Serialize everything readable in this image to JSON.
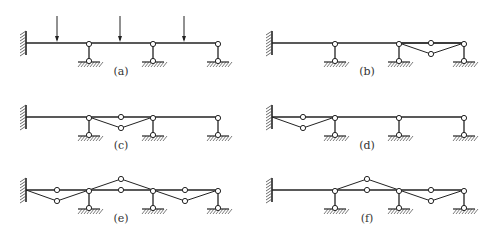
{
  "figure": {
    "panels": [
      {
        "id": "a",
        "label": "(a)",
        "ox": 0,
        "oy": 0,
        "members": [],
        "loads": [
          57,
          120,
          184
        ]
      },
      {
        "id": "b",
        "label": "(b)",
        "ox": 246,
        "oy": 0,
        "members": [
          [
            [
              153,
              43
            ],
            [
              185,
              43
            ],
            [
              218,
              43
            ],
            [
              185,
              54
            ],
            [
              153,
              43
            ]
          ]
        ],
        "hinges": [
          [
            185,
            43
          ],
          [
            185,
            54
          ]
        ],
        "loads": []
      },
      {
        "id": "c",
        "label": "(c)",
        "ox": 0,
        "oy": 74,
        "members": [
          [
            [
              89,
              43
            ],
            [
              121,
              54
            ],
            [
              153,
              43
            ]
          ]
        ],
        "hinges": [
          [
            121,
            43
          ],
          [
            121,
            54
          ]
        ],
        "loads": []
      },
      {
        "id": "d",
        "label": "(d)",
        "ox": 246,
        "oy": 74,
        "members": [
          [
            [
              26,
              43
            ],
            [
              57,
              54
            ],
            [
              89,
              43
            ]
          ]
        ],
        "hinges": [
          [
            57,
            43
          ],
          [
            57,
            54
          ]
        ],
        "loads": []
      },
      {
        "id": "e",
        "label": "(e)",
        "ox": 0,
        "oy": 147,
        "members": [
          [
            [
              26,
              43
            ],
            [
              57,
              54
            ],
            [
              89,
              43
            ]
          ],
          [
            [
              89,
              43
            ],
            [
              121,
              32
            ],
            [
              153,
              43
            ]
          ],
          [
            [
              153,
              43
            ],
            [
              185,
              54
            ],
            [
              218,
              43
            ]
          ]
        ],
        "hinges": [
          [
            57,
            43
          ],
          [
            57,
            54
          ],
          [
            121,
            43
          ],
          [
            121,
            32
          ],
          [
            185,
            43
          ],
          [
            185,
            54
          ]
        ],
        "loads": []
      },
      {
        "id": "f",
        "label": "(f)",
        "ox": 246,
        "oy": 147,
        "members": [
          [
            [
              89,
              43
            ],
            [
              121,
              32
            ],
            [
              153,
              43
            ]
          ],
          [
            [
              153,
              43
            ],
            [
              185,
              54
            ],
            [
              218,
              43
            ]
          ]
        ],
        "hinges": [
          [
            121,
            43
          ],
          [
            121,
            32
          ],
          [
            185,
            43
          ],
          [
            185,
            54
          ]
        ],
        "loads": []
      }
    ],
    "beam": {
      "x_start": 26,
      "x_end": 218,
      "y": 43
    },
    "supports_x": [
      89,
      153,
      218
    ],
    "colors": {
      "line": "#222222",
      "hatch": "#444444"
    }
  }
}
